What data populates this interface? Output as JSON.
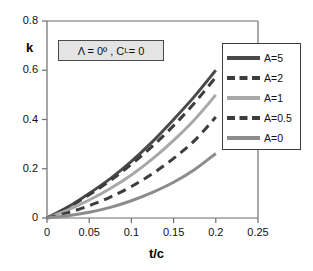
{
  "chart_data": {
    "type": "line",
    "title": "",
    "xlabel": "t/c",
    "ylabel": "k",
    "xlim": [
      0,
      0.25
    ],
    "ylim": [
      0,
      0.8
    ],
    "xticks": [
      "0",
      "0.05",
      "0.1",
      "0.15",
      "0.2",
      "0.25"
    ],
    "yticks": [
      "0",
      "0.2",
      "0.4",
      "0.6",
      "0.8"
    ],
    "xtick_values": [
      0,
      0.05,
      0.1,
      0.15,
      0.2,
      0.25
    ],
    "ytick_values": [
      0,
      0.2,
      0.4,
      0.6,
      0.8
    ],
    "grid": false,
    "legend_position": "right-inside",
    "annotation": "Λ = 0º , C_L = 0",
    "annotation_parts": {
      "lambda": "Λ = 0º , C",
      "subscript": "L",
      "tail": " = 0"
    },
    "x": [
      0,
      0.025,
      0.05,
      0.075,
      0.1,
      0.125,
      0.15,
      0.175,
      0.2
    ],
    "series": [
      {
        "name": "A=5",
        "color": "#4a4a4a",
        "style": "solid",
        "width": 3,
        "values": [
          0,
          0.045,
          0.1,
          0.16,
          0.23,
          0.31,
          0.4,
          0.495,
          0.6
        ]
      },
      {
        "name": "A=2",
        "color": "#3d3d3d",
        "style": "dashed",
        "width": 3,
        "values": [
          0,
          0.042,
          0.094,
          0.152,
          0.218,
          0.292,
          0.375,
          0.468,
          0.572
        ]
      },
      {
        "name": "A=1",
        "color": "#a8a8a8",
        "style": "solid",
        "width": 3,
        "values": [
          0,
          0.033,
          0.073,
          0.12,
          0.175,
          0.24,
          0.315,
          0.4,
          0.5
        ]
      },
      {
        "name": "A=0.5",
        "color": "#3d3d3d",
        "style": "dashed",
        "width": 3,
        "values": [
          0,
          0.022,
          0.05,
          0.085,
          0.128,
          0.18,
          0.242,
          0.315,
          0.41
        ]
      },
      {
        "name": "A=0",
        "color": "#8c8c8c",
        "style": "solid",
        "width": 3,
        "values": [
          0,
          0.009,
          0.023,
          0.043,
          0.07,
          0.104,
          0.145,
          0.197,
          0.262
        ]
      }
    ]
  },
  "axes": {
    "frame_color": "#6d6d6d",
    "tick_color": "#6d6d6d"
  }
}
